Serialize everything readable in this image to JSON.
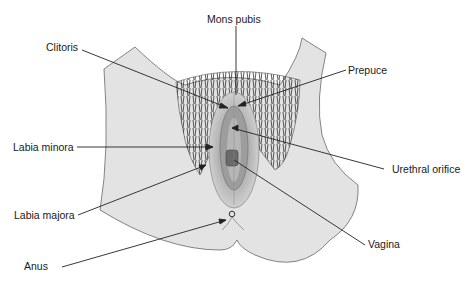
{
  "diagram": {
    "labels": [
      {
        "id": "mons-pubis",
        "text": "Mons pubis"
      },
      {
        "id": "clitoris",
        "text": "Clitoris"
      },
      {
        "id": "prepuce",
        "text": "Prepuce"
      },
      {
        "id": "labia-minora",
        "text": "Labia minora"
      },
      {
        "id": "urethral-orifice",
        "text": "Urethral orifice"
      },
      {
        "id": "labia-majora",
        "text": "Labia majora"
      },
      {
        "id": "vagina",
        "text": "Vagina"
      },
      {
        "id": "anus",
        "text": "Anus"
      }
    ],
    "colors": {
      "skin": "#e3e3e3",
      "outline": "#555555",
      "hair": "#3a3a3a",
      "labia_outer": "#c8c8c8",
      "labia_inner": "#a8a8a8",
      "leader_line": "#222222"
    }
  }
}
